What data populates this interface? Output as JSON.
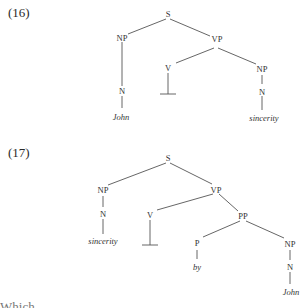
{
  "examples": [
    {
      "label": "(16)",
      "nodes": {
        "S": "S",
        "NP": "NP",
        "VP": "VP",
        "N": "N",
        "V": "V",
        "NP2": "NP",
        "N2": "N",
        "word1": "John",
        "word2": "sincerity"
      }
    },
    {
      "label": "(17)",
      "nodes": {
        "S": "S",
        "NP": "NP",
        "VP": "VP",
        "N": "N",
        "V": "V",
        "PP": "PP",
        "P": "P",
        "NP2": "NP",
        "N2": "N",
        "word1": "sincerity",
        "word2": "by",
        "word3": "John"
      }
    }
  ],
  "footer_partial_text": "Which ... ... ..."
}
